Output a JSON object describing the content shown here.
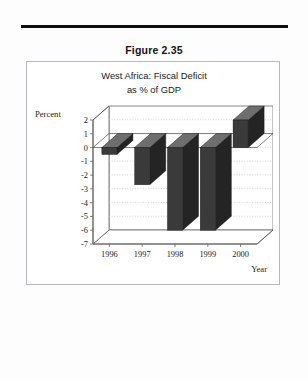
{
  "document": {
    "figure_caption": "Figure 2.35"
  },
  "chart_data": {
    "type": "bar",
    "title": "West Africa: Fiscal Deficit as % of GDP",
    "title_line1": "West Africa: Fiscal Deficit",
    "title_line2": "as % of GDP",
    "xlabel": "Year",
    "ylabel": "Percent",
    "categories": [
      "1996",
      "1997",
      "1998",
      "1999",
      "2000"
    ],
    "values": [
      -0.5,
      -2.7,
      -6.0,
      -6.0,
      2.0
    ],
    "ylim": [
      -7,
      2
    ],
    "yticks": [
      2,
      1,
      0,
      -1,
      -2,
      -3,
      -4,
      -5,
      -6,
      -7
    ],
    "ytick_labels": [
      "2",
      "1",
      "0",
      "-1",
      "-2",
      "-3",
      "-4",
      "-5",
      "-6",
      "-7"
    ],
    "grid": true,
    "legend": "none",
    "style": "3d-column",
    "bar_color": "#3a3a3a",
    "bar_top_color": "#6e6e6e",
    "bar_side_color": "#242424",
    "gridline_color": "#bdbdbd",
    "axis_color": "#555555",
    "wall_color": "#ffffff"
  }
}
